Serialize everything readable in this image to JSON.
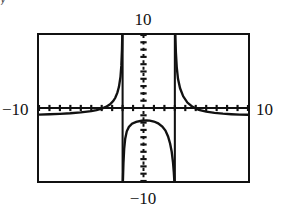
{
  "figure": {
    "kind": "graphing-calculator-screen",
    "clipped_text_above": "y",
    "ink_color": "#111111",
    "background_color": "#ffffff"
  },
  "labels": {
    "top": "10",
    "bottom": "−10",
    "left": "−10",
    "right": "10"
  },
  "chart_data": {
    "type": "line",
    "title": "",
    "subtitle": "",
    "xlabel": "",
    "ylabel": "",
    "xlim": [
      -10,
      10
    ],
    "ylim": [
      -10,
      10
    ],
    "xtick_labels": [
      "-10",
      "10"
    ],
    "ytick_labels": [
      "-10",
      "10"
    ],
    "tick_spacing": 1,
    "tick_style": "dotted-marks-on-axes",
    "grid": false,
    "legend": null,
    "legend_position": "none",
    "axes_shown": [
      "x-axis at y=0",
      "y-axis at x=0"
    ],
    "annotations": [
      "vertical asymptote drawn as near-vertical connecting segment at x ≈ -2",
      "vertical asymptote drawn as near-vertical connecting segment at x ≈ 3",
      "horizontal asymptote approached at y ≈ -1"
    ],
    "asymptotes": {
      "vertical": [
        -2,
        3
      ],
      "horizontal": [
        -1
      ]
    },
    "series": [
      {
        "name": "branch-left",
        "description": "left branch: comes in from x=-10 just below y=-1 and rises to +infinity as x approaches -2 from the left",
        "x": [
          -10,
          -9,
          -8,
          -7,
          -6,
          -5,
          -4.5,
          -4,
          -3.6,
          -3.2,
          -2.9,
          -2.7,
          -2.5,
          -2.35,
          -2.2,
          -2.12,
          -2.06,
          -2.03
        ],
        "y": [
          -0.9,
          -0.85,
          -0.8,
          -0.72,
          -0.6,
          -0.42,
          -0.28,
          -0.08,
          0.15,
          0.5,
          0.95,
          1.4,
          2.1,
          2.9,
          4.3,
          5.8,
          8.0,
          10.0
        ]
      },
      {
        "name": "branch-middle",
        "description": "middle branch between the asymptotes: falls from -infinity at x=-2, rises to a local maximum near x=0.4, then falls to -infinity at x=3",
        "x": [
          -1.97,
          -1.92,
          -1.85,
          -1.75,
          -1.6,
          -1.4,
          -1.1,
          -0.7,
          -0.2,
          0.3,
          0.6,
          1.0,
          1.4,
          1.8,
          2.1,
          2.35,
          2.55,
          2.7,
          2.82,
          2.9,
          2.95
        ],
        "y": [
          -10.0,
          -7.6,
          -5.6,
          -4.2,
          -3.2,
          -2.6,
          -2.15,
          -1.9,
          -1.75,
          -1.7,
          -1.72,
          -1.85,
          -2.1,
          -2.55,
          -3.1,
          -3.9,
          -4.9,
          -6.0,
          -7.4,
          -8.8,
          -10.0
        ]
      },
      {
        "name": "branch-right",
        "description": "right branch: drops from +infinity at x=3 and flattens toward the horizontal asymptote y=-1 as x grows to 10",
        "x": [
          3.05,
          3.1,
          3.18,
          3.3,
          3.5,
          3.8,
          4.2,
          4.7,
          5.3,
          6.0,
          6.8,
          7.6,
          8.4,
          9.2,
          10
        ],
        "y": [
          10.0,
          7.6,
          5.6,
          4.0,
          2.7,
          1.6,
          0.75,
          0.15,
          -0.25,
          -0.5,
          -0.68,
          -0.78,
          -0.85,
          -0.9,
          -0.93
        ]
      }
    ]
  }
}
